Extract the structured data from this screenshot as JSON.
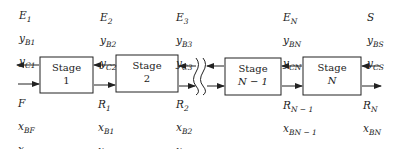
{
  "diagram": {
    "title": "",
    "stages": [
      {
        "id": "stage-1",
        "line1": "Stage",
        "line2": "1"
      },
      {
        "id": "stage-2",
        "line1": "Stage",
        "line2": "2"
      },
      {
        "id": "stage-n-1",
        "line1": "Stage",
        "line2": "N − 1"
      },
      {
        "id": "stage-n",
        "line1": "Stage",
        "line2": "N"
      }
    ],
    "top_labels": [
      {
        "stream": "E",
        "stream_sub": "1",
        "yb": "y",
        "yb_sub": "B1",
        "yc": "y",
        "yc_sub": "C1"
      },
      {
        "stream": "E",
        "stream_sub": "2",
        "yb": "y",
        "yb_sub": "B2",
        "yc": "y",
        "yc_sub": "C2"
      },
      {
        "stream": "E",
        "stream_sub": "3",
        "yb": "y",
        "yb_sub": "B3",
        "yc": "y",
        "yc_sub": "C3"
      },
      {
        "stream": "E",
        "stream_sub": "N",
        "yb": "y",
        "yb_sub": "BN",
        "yc": "y",
        "yc_sub": "CN"
      },
      {
        "stream": "S",
        "stream_sub": "",
        "yb": "y",
        "yb_sub": "BS",
        "yc": "y",
        "yc_sub": "CS"
      }
    ],
    "bottom_labels": [
      {
        "stream": "F",
        "stream_sub": "",
        "xb": "x",
        "xb_sub": "BF",
        "xc": "x",
        "xc_sub": "CF"
      },
      {
        "stream": "R",
        "stream_sub": "1",
        "xb": "x",
        "xb_sub": "B1",
        "xc": "x",
        "xc_sub": "C1"
      },
      {
        "stream": "R",
        "stream_sub": "2",
        "xb": "x",
        "xb_sub": "B2",
        "xc": "x",
        "xc_sub": "C2"
      },
      {
        "stream": "R",
        "stream_sub": "N − 1",
        "xb": "x",
        "xb_sub": "BN − 1",
        "xc": "x",
        "xc_sub": "CN − 1"
      },
      {
        "stream": "R",
        "stream_sub": "N",
        "xb": "x",
        "xb_sub": "BN",
        "xc": "x",
        "xc_sub": "CN"
      }
    ],
    "colors": {
      "line": "#222222",
      "background": "#ffffff"
    }
  }
}
